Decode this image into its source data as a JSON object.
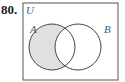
{
  "problem": {
    "number": "80."
  },
  "diagram": {
    "universe_label": "U",
    "set_a_label": "A",
    "set_b_label": "B",
    "shaded_region": "A minus B",
    "colors": {
      "shade": "#e0e0e0",
      "stroke": "#444444",
      "border": "#555555"
    }
  }
}
